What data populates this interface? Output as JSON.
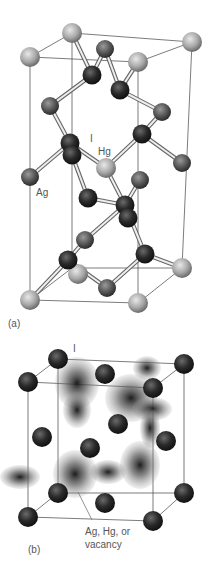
{
  "panel_a": {
    "caption": "(a)",
    "labels": {
      "I": "I",
      "Hg": "Hg",
      "Ag": "Ag"
    },
    "box": {
      "top": [
        [
          72,
          33
        ],
        [
          192,
          42
        ],
        [
          138,
          62
        ],
        [
          30,
          57
        ]
      ],
      "bottom": [
        [
          72,
          268
        ],
        [
          182,
          268
        ],
        [
          138,
          303
        ],
        [
          30,
          300
        ]
      ]
    },
    "light_atoms": [
      [
        72,
        33
      ],
      [
        192,
        42
      ],
      [
        138,
        62
      ],
      [
        30,
        57
      ],
      [
        106,
        168
      ],
      [
        30,
        300
      ],
      [
        182,
        268
      ],
      [
        138,
        303
      ],
      [
        78,
        274
      ]
    ],
    "mid_atoms": [
      [
        105,
        49
      ],
      [
        50,
        106
      ],
      [
        162,
        112
      ],
      [
        30,
        177
      ],
      [
        182,
        163
      ],
      [
        140,
        180
      ],
      [
        85,
        240
      ],
      [
        107,
        288
      ]
    ],
    "dark_atoms": [
      [
        92,
        75
      ],
      [
        120,
        90
      ],
      [
        70,
        143
      ],
      [
        142,
        134
      ],
      [
        72,
        155
      ],
      [
        88,
        198
      ],
      [
        125,
        205
      ],
      [
        128,
        218
      ],
      [
        68,
        260
      ],
      [
        145,
        254
      ]
    ],
    "bonds": [
      [
        [
          72,
          33
        ],
        [
          92,
          75
        ]
      ],
      [
        [
          92,
          75
        ],
        [
          105,
          49
        ]
      ],
      [
        [
          105,
          49
        ],
        [
          120,
          90
        ]
      ],
      [
        [
          120,
          90
        ],
        [
          138,
          62
        ]
      ],
      [
        [
          92,
          75
        ],
        [
          50,
          106
        ]
      ],
      [
        [
          120,
          90
        ],
        [
          162,
          112
        ]
      ],
      [
        [
          50,
          106
        ],
        [
          70,
          143
        ]
      ],
      [
        [
          162,
          112
        ],
        [
          142,
          134
        ]
      ],
      [
        [
          70,
          143
        ],
        [
          106,
          168
        ]
      ],
      [
        [
          142,
          134
        ],
        [
          106,
          168
        ]
      ],
      [
        [
          142,
          134
        ],
        [
          182,
          163
        ]
      ],
      [
        [
          70,
          143
        ],
        [
          30,
          177
        ]
      ],
      [
        [
          106,
          168
        ],
        [
          125,
          205
        ]
      ],
      [
        [
          72,
          155
        ],
        [
          88,
          198
        ]
      ],
      [
        [
          88,
          198
        ],
        [
          125,
          205
        ]
      ],
      [
        [
          125,
          205
        ],
        [
          140,
          180
        ]
      ],
      [
        [
          125,
          205
        ],
        [
          145,
          254
        ]
      ],
      [
        [
          125,
          205
        ],
        [
          85,
          240
        ]
      ],
      [
        [
          85,
          240
        ],
        [
          68,
          260
        ]
      ],
      [
        [
          68,
          260
        ],
        [
          30,
          300
        ]
      ],
      [
        [
          68,
          260
        ],
        [
          107,
          288
        ]
      ],
      [
        [
          107,
          288
        ],
        [
          145,
          254
        ]
      ],
      [
        [
          145,
          254
        ],
        [
          182,
          268
        ]
      ],
      [
        [
          68,
          260
        ],
        [
          78,
          274
        ]
      ]
    ]
  },
  "panel_b": {
    "caption": "(b)",
    "labels": {
      "I": "I",
      "site_line1": "Ag, Hg, or",
      "site_line2": "vacancy"
    },
    "box": {
      "top": [
        [
          58,
          359
        ],
        [
          184,
          364
        ],
        [
          153,
          388
        ],
        [
          28,
          382
        ]
      ],
      "bottom": [
        [
          58,
          493
        ],
        [
          184,
          493
        ],
        [
          153,
          521
        ],
        [
          28,
          517
        ]
      ]
    },
    "atoms": [
      [
        58,
        359
      ],
      [
        184,
        364
      ],
      [
        153,
        388
      ],
      [
        28,
        382
      ],
      [
        105,
        374
      ],
      [
        118,
        424
      ],
      [
        42,
        437
      ],
      [
        166,
        441
      ],
      [
        90,
        448
      ],
      [
        58,
        493
      ],
      [
        184,
        493
      ],
      [
        153,
        521
      ],
      [
        28,
        517
      ],
      [
        105,
        503
      ]
    ],
    "clouds": [
      [
        77,
        383,
        22,
        26
      ],
      [
        131,
        398,
        26,
        24
      ],
      [
        77,
        410,
        14,
        18
      ],
      [
        152,
        409,
        20,
        12
      ],
      [
        75,
        474,
        22,
        24
      ],
      [
        140,
        465,
        20,
        24
      ],
      [
        150,
        428,
        10,
        20
      ],
      [
        20,
        477,
        20,
        12
      ],
      [
        108,
        472,
        18,
        12
      ],
      [
        147,
        368,
        14,
        12
      ]
    ]
  }
}
